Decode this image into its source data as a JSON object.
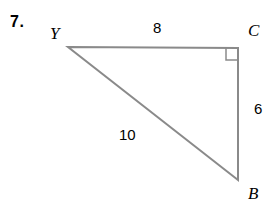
{
  "problem": {
    "number": "7."
  },
  "figure": {
    "type": "right-triangle",
    "background_color": "#ffffff",
    "stroke_color": "#8a8a8a",
    "stroke_width": 2,
    "text_color": "#000000",
    "vertices": [
      {
        "name": "Y",
        "label": "Y",
        "x": 68,
        "y": 47
      },
      {
        "name": "C",
        "label": "C",
        "x": 238,
        "y": 48
      },
      {
        "name": "B",
        "label": "B",
        "x": 238,
        "y": 180
      }
    ],
    "sides": [
      {
        "name": "YC",
        "label": "8",
        "from": "Y",
        "to": "C",
        "position": "top"
      },
      {
        "name": "CB",
        "label": "6",
        "from": "C",
        "to": "B",
        "position": "right"
      },
      {
        "name": "BY",
        "label": "10",
        "from": "B",
        "to": "Y",
        "position": "hypotenuse"
      }
    ],
    "right_angle": {
      "at_vertex": "C",
      "marker": "square",
      "size": 12
    }
  }
}
